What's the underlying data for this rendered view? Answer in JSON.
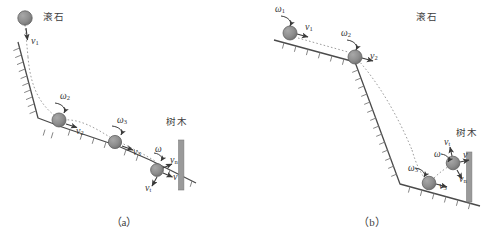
{
  "figure": {
    "background_color": "#ffffff",
    "ink_color": "#4a4a4a",
    "ball_fill": "#8f8f8f",
    "ball_stroke": "#5a5a5a",
    "tree_fill": "#9a9a9a",
    "dotted_color": "#b0b0b0"
  },
  "panel_a": {
    "caption": "（a）",
    "stone_label": "滚石",
    "tree_label": "树木",
    "labels": [
      {
        "name": "v1-top",
        "text": "v",
        "sub": "1"
      },
      {
        "name": "omega2",
        "text": "ω",
        "sub": "2"
      },
      {
        "name": "v2",
        "text": "v",
        "sub": "2"
      },
      {
        "name": "omega3",
        "text": "ω",
        "sub": "3"
      },
      {
        "name": "v3",
        "text": "v",
        "sub": "3"
      },
      {
        "name": "omega",
        "text": "ω",
        "sub": ""
      },
      {
        "name": "vn",
        "text": "v",
        "sub": "n"
      },
      {
        "name": "v",
        "text": "v",
        "sub": ""
      },
      {
        "name": "vt",
        "text": "v",
        "sub": "t"
      }
    ]
  },
  "panel_b": {
    "caption": "（b）",
    "stone_label": "滚石",
    "tree_label": "树木",
    "labels": [
      {
        "name": "omega1",
        "text": "ω",
        "sub": "1"
      },
      {
        "name": "v1",
        "text": "v",
        "sub": "1"
      },
      {
        "name": "omega2",
        "text": "ω",
        "sub": "2"
      },
      {
        "name": "v2",
        "text": "v",
        "sub": "2"
      },
      {
        "name": "omega3",
        "text": "ω",
        "sub": "3"
      },
      {
        "name": "v3",
        "text": "v",
        "sub": "3"
      },
      {
        "name": "omega",
        "text": "ω",
        "sub": ""
      },
      {
        "name": "vt",
        "text": "v",
        "sub": "t"
      },
      {
        "name": "v",
        "text": "v",
        "sub": ""
      },
      {
        "name": "vn",
        "text": "v",
        "sub": "n"
      }
    ]
  }
}
